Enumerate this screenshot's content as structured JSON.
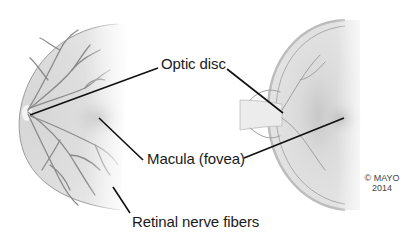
{
  "diagram": {
    "type": "anatomical illustration",
    "labels": {
      "optic_disc": "Optic disc",
      "macula": "Macula (fovea)",
      "nerve_fibers": "Retinal nerve fibers"
    },
    "copyright": {
      "line1": "© MAYO",
      "line2": "2014"
    },
    "colors": {
      "background": "#ffffff",
      "retina_fill": "#e4e4e4",
      "vessel": "#8a8a8a",
      "leader_line": "#111111",
      "text": "#1a1a1a"
    }
  }
}
